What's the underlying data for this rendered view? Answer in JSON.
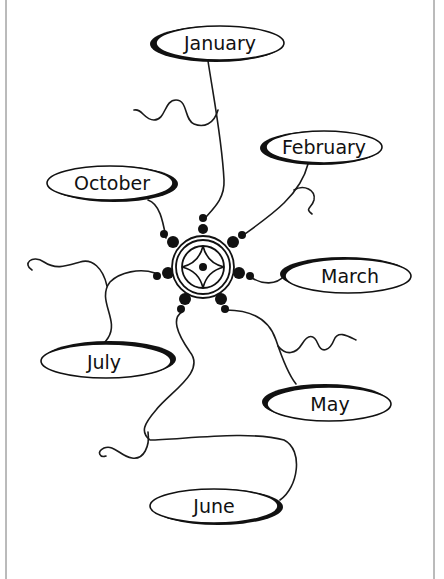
{
  "diagram": {
    "type": "mind-map",
    "center": {
      "icon": "compass-star-icon"
    },
    "nodes": [
      {
        "id": "january",
        "label": "January"
      },
      {
        "id": "february",
        "label": "February"
      },
      {
        "id": "march",
        "label": "March"
      },
      {
        "id": "may",
        "label": "May"
      },
      {
        "id": "june",
        "label": "June"
      },
      {
        "id": "july",
        "label": "July"
      },
      {
        "id": "october",
        "label": "October"
      }
    ],
    "colors": {
      "ink": "#111111",
      "background": "#ffffff",
      "border": "#777777"
    }
  }
}
